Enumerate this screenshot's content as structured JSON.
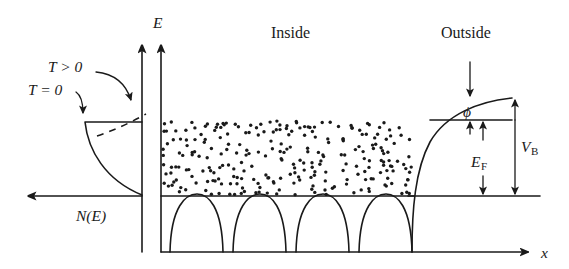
{
  "figure": {
    "title_region_inside": "Inside",
    "title_region_outside": "Outside",
    "axis_energy_label": "E",
    "axis_position_label": "x",
    "dos_axis_label": "N(E)",
    "temperature_zero_label": "T = 0",
    "temperature_positive_label": "T > 0",
    "work_function_label": "ϕ",
    "fermi_energy_label": "E",
    "fermi_energy_sub": "F",
    "barrier_label": "V",
    "barrier_sub": "B",
    "colors": {
      "ink": "#1a1a1a",
      "background": "#ffffff"
    }
  },
  "chart_data": {
    "type": "line",
    "xlabel": "x",
    "ylabel": "E",
    "grid": false,
    "legend": false,
    "annotations": [
      "Inside",
      "Outside",
      "T = 0",
      "T > 0",
      "ϕ",
      "E_F",
      "V_B",
      "N(E)"
    ],
    "levels": {
      "vacuum_level_y_px": 98,
      "intermediate_level_y_px": 120,
      "fermi_level_y_px": 196,
      "lattice_baseline_y_px": 252
    },
    "quantities": {
      "work_function_phi": "ϕ = vacuum level − Fermi level",
      "fermi_energy_EF": "E_F = Fermi level − bottom of conduction band",
      "barrier_height_VB": "V_B = ϕ + E_F"
    },
    "series": [
      {
        "name": "Density of states N(E) at T = 0",
        "description": "Sharp cutoff at the Fermi level; parabolic sqrt(E) shape below"
      },
      {
        "name": "Fermi-Dirac smearing at T > 0",
        "description": "Dashed curve rounding the step at the Fermi level"
      },
      {
        "name": "Periodic lattice potential wells",
        "count": 4,
        "description": "Four arch-shaped ion core potentials inside the metal"
      },
      {
        "name": "Image-force surface barrier",
        "description": "Potential rises smoothly from the metal surface to the vacuum level outside"
      }
    ],
    "electron_sea": {
      "description": "Filled electron states shown as stippled dots between the band bottom and the Fermi level",
      "dot_count": 260
    }
  }
}
